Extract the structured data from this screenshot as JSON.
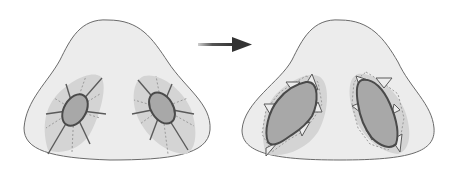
{
  "diagram": {
    "panels": [
      {
        "id": "before",
        "label": "",
        "nostril_shape": "small-ellipse-with-radial-lines"
      },
      {
        "id": "after",
        "label": "",
        "nostril_shape": "enlarged-irregular-with-triangular-flaps"
      }
    ],
    "arrow": {
      "direction": "right",
      "icon": "arrow-right-icon"
    },
    "colors": {
      "nose_fill": "#ececec",
      "nose_stroke": "#6a6a6a",
      "zone_fill": "#d4d4d4",
      "nostril_fill": "#a8a8a8",
      "nostril_stroke": "#4a4a4a",
      "radial_line": "#5a5a5a",
      "dotted_line": "#9a9a9a",
      "arrow": "#333333"
    }
  }
}
